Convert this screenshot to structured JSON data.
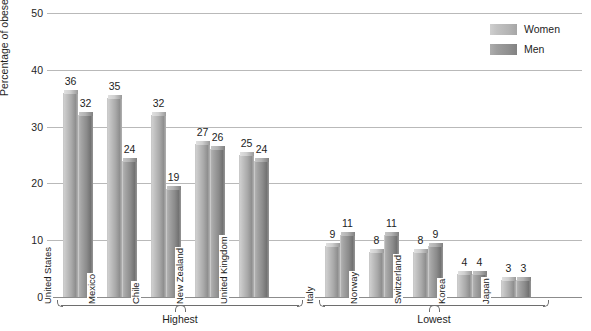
{
  "chart_data": {
    "type": "bar",
    "title": "",
    "xlabel": "",
    "ylabel": "Percentage of obese adults",
    "ylim": [
      0,
      50
    ],
    "yticks": [
      0,
      10,
      20,
      30,
      40,
      50
    ],
    "grid": true,
    "legend_position": "top-right",
    "categories": [
      "United States",
      "Mexico",
      "Chile",
      "New Zealand",
      "United Kingdom",
      "Italy",
      "Norway",
      "Switzerland",
      "Korea",
      "Japan"
    ],
    "series": [
      {
        "name": "Women",
        "color": "#b4b4b4",
        "values": [
          36,
          35,
          32,
          27,
          25,
          9,
          8,
          8,
          4,
          3
        ]
      },
      {
        "name": "Men",
        "color": "#8b8b8b",
        "values": [
          32,
          24,
          19,
          26,
          24,
          11,
          11,
          9,
          4,
          3
        ]
      }
    ],
    "groups": [
      {
        "label": "Highest",
        "categories": [
          "United States",
          "Mexico",
          "Chile",
          "New Zealand",
          "United Kingdom"
        ]
      },
      {
        "label": "Lowest",
        "categories": [
          "Italy",
          "Norway",
          "Switzerland",
          "Korea",
          "Japan"
        ]
      }
    ]
  },
  "legend": {
    "items": [
      {
        "label": "Women",
        "swatch": "women-swatch"
      },
      {
        "label": "Men",
        "swatch": "men-swatch"
      }
    ]
  },
  "axis": {
    "y_label": "Percentage of obese adults",
    "y_ticks": [
      "0",
      "10",
      "20",
      "30",
      "40",
      "50"
    ]
  }
}
